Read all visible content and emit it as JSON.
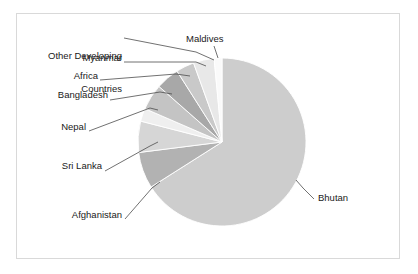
{
  "chart_data": {
    "type": "pie",
    "title": "",
    "subtitle": "",
    "xlabel": "",
    "ylabel": "",
    "legend_position": "none",
    "grid": false,
    "labels_style": "leader-line callouts",
    "start_angle_deg": 0,
    "direction": "clockwise",
    "categories": [
      "Bhutan",
      "Afghanistan",
      "Sri Lanka",
      "Nepal",
      "Bangladesh",
      "Africa",
      "Myanmar",
      "Other Developing Countries",
      "Maldives"
    ],
    "values": [
      66.0,
      7.0,
      6.0,
      2.5,
      5.0,
      4.5,
      3.5,
      4.0,
      1.5
    ],
    "unit": "percent",
    "slices": [
      {
        "label": "Bhutan",
        "value": 66.0,
        "color": "#cdcdcd",
        "start_deg": 0,
        "end_deg": 237.6
      },
      {
        "label": "Afghanistan",
        "value": 7.0,
        "color": "#b2b2b2",
        "start_deg": 237.6,
        "end_deg": 262.8
      },
      {
        "label": "Sri Lanka",
        "value": 6.0,
        "color": "#d6d6d6",
        "start_deg": 262.8,
        "end_deg": 284.4
      },
      {
        "label": "Nepal",
        "value": 2.5,
        "color": "#efefef",
        "start_deg": 284.4,
        "end_deg": 293.4
      },
      {
        "label": "Bangladesh",
        "value": 5.0,
        "color": "#c4c4c4",
        "start_deg": 293.4,
        "end_deg": 311.4
      },
      {
        "label": "Africa",
        "value": 4.5,
        "color": "#a8a8a8",
        "start_deg": 311.4,
        "end_deg": 327.6
      },
      {
        "label": "Myanmar",
        "value": 3.5,
        "color": "#c9c9c9",
        "start_deg": 327.6,
        "end_deg": 340.2
      },
      {
        "label": "Other Developing Countries",
        "value": 4.0,
        "color": "#e8e8e8",
        "start_deg": 340.2,
        "end_deg": 354.6
      },
      {
        "label": "Maldives",
        "value": 1.5,
        "color": "#fafafa",
        "start_deg": 354.6,
        "end_deg": 360.0
      }
    ]
  },
  "figure": {
    "background_color": "#ffffff",
    "frame_color": "#d9d9d9",
    "text_color": "#1a1a1a",
    "leader_color": "#4d4d4d"
  },
  "labels": {
    "other_developing_line1": "Other Developing",
    "other_developing_line2": "Countries",
    "maldives": "Maldives",
    "myanmar": "Myanmar",
    "africa": "Africa",
    "bangladesh": "Bangladesh",
    "nepal": "Nepal",
    "sri_lanka": "Sri Lanka",
    "afghanistan": "Afghanistan",
    "bhutan": "Bhutan"
  }
}
